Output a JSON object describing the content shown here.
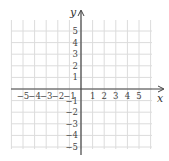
{
  "chart_data": {
    "type": "scatter",
    "title": "",
    "xlabel": "x",
    "ylabel": "y",
    "x_ticks": [
      -5,
      -4,
      -3,
      -2,
      -1,
      1,
      2,
      3,
      4,
      5
    ],
    "y_ticks": [
      5,
      4,
      3,
      2,
      1,
      -1,
      -2,
      -3,
      -4,
      -5
    ],
    "xlim": [
      -6,
      6
    ],
    "ylim": [
      -5.3,
      6
    ],
    "grid": true,
    "series": []
  },
  "labels": {
    "x": "x",
    "y": "y"
  }
}
